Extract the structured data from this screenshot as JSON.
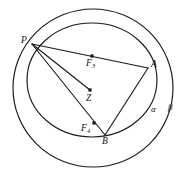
{
  "figure": {
    "background_color": "#ffffff",
    "stroke_color": "#1a1a1a",
    "curves": [
      {
        "id": "beta-circle",
        "name": "circle-beta",
        "kind": "circle",
        "cx": 93,
        "cy": 88,
        "rx": 80,
        "ry": 79
      },
      {
        "id": "alpha-circle",
        "name": "circle-alpha",
        "kind": "ellipse",
        "cx": 92,
        "cy": 80,
        "rx": 65,
        "ry": 57
      }
    ],
    "points": [
      {
        "id": "P",
        "label": "P",
        "sub": "",
        "x": 32,
        "y": 44,
        "dot": false,
        "label_x": 21,
        "label_y": 36
      },
      {
        "id": "A",
        "label": "A",
        "sub": "",
        "x": 148,
        "y": 68,
        "dot": false,
        "label_x": 151,
        "label_y": 60
      },
      {
        "id": "B",
        "label": "B",
        "sub": "",
        "x": 105,
        "y": 135,
        "dot": false,
        "label_x": 102,
        "label_y": 137
      },
      {
        "id": "Z",
        "label": "Z",
        "sub": "",
        "x": 90,
        "y": 90,
        "dot": true,
        "label_x": 86,
        "label_y": 94
      },
      {
        "id": "F3",
        "label": "F",
        "sub": "3",
        "x": 92,
        "y": 56,
        "dot": true,
        "label_x": 86,
        "label_y": 59
      },
      {
        "id": "F4",
        "label": "F",
        "sub": "4",
        "x": 94,
        "y": 123,
        "dot": true,
        "label_x": 81,
        "label_y": 124
      }
    ],
    "segments": [
      {
        "id": "PA",
        "name": "segment-p-a",
        "from": "P",
        "to": "A"
      },
      {
        "id": "PB",
        "name": "segment-p-b",
        "from": "P",
        "to": "B"
      },
      {
        "id": "PZ",
        "name": "segment-p-z",
        "from": "P",
        "to": "Z"
      },
      {
        "id": "AB",
        "name": "segment-a-b",
        "from": "A",
        "to": "B"
      }
    ],
    "curve_labels": [
      {
        "id": "alpha",
        "label": "α",
        "x": 151,
        "y": 105
      },
      {
        "id": "beta",
        "label": "β",
        "x": 168,
        "y": 103
      }
    ]
  }
}
